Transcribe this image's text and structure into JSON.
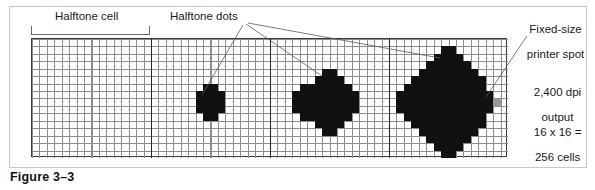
{
  "figure": {
    "caption": "Figure 3–3",
    "labels": {
      "halftone_cell": "Halftone cell",
      "halftone_dots": "Halftone dots",
      "fixed_size_printer_spot_line1": "Fixed-size",
      "fixed_size_printer_spot_line2": "printer spot",
      "resolution_line1": "2,400 dpi",
      "resolution_line2": "output",
      "cellcount_line1": "16 x 16 =",
      "cellcount_line2": "256 cells"
    },
    "colors": {
      "frame": "#c9c9c9",
      "grid_minor": "#8d8d8d",
      "grid_major": "#3a3a3a",
      "dot_fill": "#111111",
      "printer_spot": "#9a9a9a",
      "leader_line": "#5a5a5a",
      "text": "#1a1a1a",
      "background": "#ffffff"
    },
    "grid": {
      "cells_across": 4,
      "subcells_per_side": 16,
      "total_subcells_per_cell": 256
    },
    "cells": [
      {
        "index": 1,
        "name": "halftone-cell-empty",
        "coverage_percent": 0,
        "dot_pixels": 0,
        "shape": "none"
      },
      {
        "index": 2,
        "name": "halftone-cell-small",
        "coverage_percent": 8,
        "dot_pixels": 21,
        "shape": "plus"
      },
      {
        "index": 3,
        "name": "halftone-cell-medium",
        "coverage_percent": 29,
        "dot_pixels": 73,
        "shape": "octagon"
      },
      {
        "index": 4,
        "name": "halftone-cell-large",
        "coverage_percent": 55,
        "dot_pixels": 141,
        "shape": "diamond"
      }
    ]
  }
}
